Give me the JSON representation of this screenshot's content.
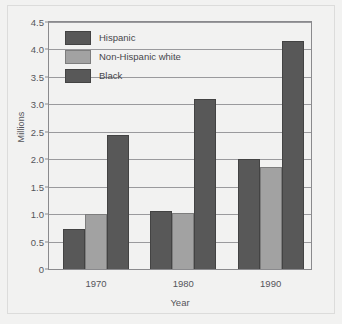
{
  "chart_data": {
    "type": "bar",
    "title": "",
    "xlabel": "Year",
    "ylabel": "Millions",
    "categories": [
      "1970",
      "1980",
      "1990"
    ],
    "series": [
      {
        "name": "Hispanic",
        "values": [
          0.72,
          1.05,
          2.0
        ],
        "color": "#585858"
      },
      {
        "name": "Non-Hispanic white",
        "values": [
          1.0,
          1.02,
          1.85
        ],
        "color": "#a2a2a2"
      },
      {
        "name": "Black",
        "values": [
          2.45,
          3.1,
          4.15
        ],
        "color": "#585858"
      }
    ],
    "ylim": [
      0,
      4.5
    ],
    "yticks": [
      "0",
      "0.5",
      "1.0",
      "1.5",
      "2.0",
      "2.5",
      "3.0",
      "3.5",
      "4.0",
      "4.5"
    ],
    "ytick_values": [
      0,
      0.5,
      1.0,
      1.5,
      2.0,
      2.5,
      3.0,
      3.5,
      4.0,
      4.5
    ],
    "grid": true,
    "legend_position": "top-left-inside"
  },
  "colors": {
    "background": "#f2f2f1",
    "axis": "#8a8a8d",
    "grid": "#9a9a9d",
    "text": "#55555a",
    "dark_bar": "#585858",
    "light_bar": "#a2a2a2"
  }
}
